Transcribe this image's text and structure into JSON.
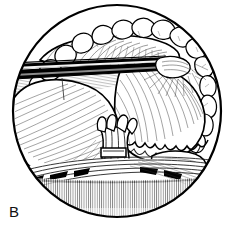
{
  "figure": {
    "panel_label": "B",
    "kind": "surgical-line-illustration",
    "shape": "circular-operative-field",
    "title": "",
    "caption": "",
    "colors": {
      "ink": "#000000",
      "paper": "#ffffff",
      "mid_gray": "#9a9a9a",
      "light_gray": "#cfcfcf",
      "hatch_gray": "#6e6e6e"
    },
    "frame": {
      "name": "operative-field-circle",
      "center_x": 117,
      "center_y": 111,
      "radius_x": 105,
      "radius_y": 107,
      "stroke_width": 2.2
    },
    "elements": {
      "retractor": {
        "name": "retractor-blade",
        "description": "black retractor blade with white highlight stripe entering from left",
        "x1": 14,
        "y1": 66,
        "x2": 168,
        "y2": 61,
        "thickness": 7,
        "highlight_color": "#ffffff",
        "body_color": "#000000"
      },
      "light_beam": {
        "name": "light-beam",
        "description": "pale gray wedge of light below the retractor",
        "color": "#d8d8d8"
      },
      "upper_lobe": {
        "name": "upper-tissue-fold",
        "description": "elongated tissue fold above retractor"
      },
      "left_lobe": {
        "name": "left-organ-lobe",
        "description": "large smooth lobe on the left with radiating hatch shading"
      },
      "right_lobe": {
        "name": "right-organ-lobe",
        "description": "large rounded lobe with scalloped serrated inferior edge"
      },
      "pedicle": {
        "name": "central-pedicle",
        "description": "central vascular pedicle with surgical clips"
      },
      "clips": {
        "name": "surgical-clips",
        "count": 3
      },
      "omentum": {
        "name": "omental-fat-lobules",
        "description": "nodular fatty lobules arrayed along the upper and left rim"
      },
      "muscle_band": {
        "name": "striated-muscle-band",
        "description": "diagonally striated muscle band across the lower field"
      },
      "floor": {
        "name": "stippled-floor",
        "description": "fine stippled shading at the bottom of the field"
      }
    }
  }
}
